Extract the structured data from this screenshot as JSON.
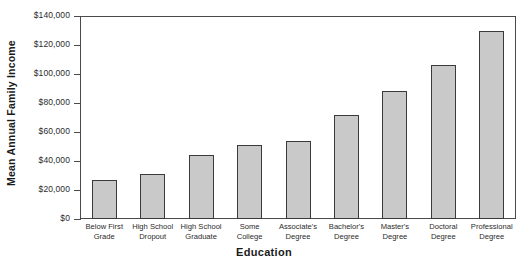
{
  "chart_data": {
    "type": "bar",
    "title": "",
    "xlabel": "Education",
    "ylabel": "Mean Annual Family Income",
    "categories": [
      "Below First Grade",
      "High School Dropout",
      "High School Graduate",
      "Some College",
      "Associate's Degree",
      "Bachelor's Degree",
      "Master's Degree",
      "Doctoral Degree",
      "Professional Degree"
    ],
    "category_lines": [
      [
        "Below First",
        "Grade"
      ],
      [
        "High School",
        "Dropout"
      ],
      [
        "High School",
        "Graduate"
      ],
      [
        "Some",
        "College"
      ],
      [
        "Associate's",
        "Degree"
      ],
      [
        "Bachelor's",
        "Degree"
      ],
      [
        "Master's",
        "Degree"
      ],
      [
        "Doctoral",
        "Degree"
      ],
      [
        "Professional",
        "Degree"
      ]
    ],
    "values": [
      27000,
      31000,
      44000,
      51000,
      54000,
      72000,
      88000,
      106000,
      130000
    ],
    "ylim": [
      0,
      140000
    ],
    "ytick_values": [
      0,
      20000,
      40000,
      60000,
      80000,
      100000,
      120000,
      140000
    ],
    "ytick_labels": [
      "$0",
      "$20,000",
      "$40,000",
      "$60,000",
      "$80,000",
      "$100,000",
      "$120,000",
      "$140,000"
    ],
    "grid": false,
    "legend": null,
    "bar_fill_color": "#c9c9c9",
    "bar_edge_color": "#3a3a3a",
    "axis_color": "#4a4a4a"
  }
}
